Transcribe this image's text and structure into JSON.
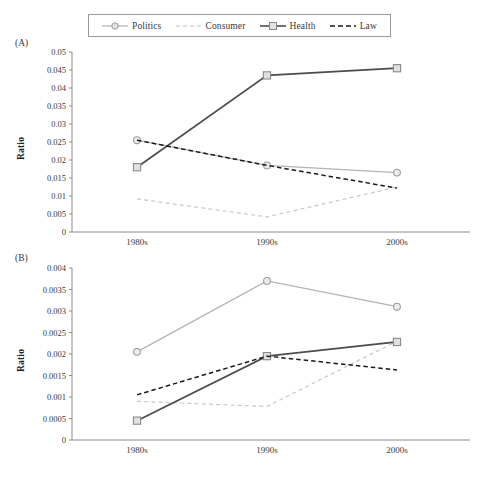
{
  "figure": {
    "panel_a_label": "(A)",
    "panel_b_label": "(B)",
    "y_axis_title": "Ratio"
  },
  "legend": {
    "items": [
      {
        "label": "Politics",
        "style": "solid-circle",
        "color": "#b3b3b3",
        "marker": "circle"
      },
      {
        "label": "Consumer",
        "style": "dashed",
        "color": "#c8c8c8",
        "marker": "none"
      },
      {
        "label": "Health",
        "style": "solid-square",
        "color": "#4d4d4d",
        "marker": "square"
      },
      {
        "label": "Law",
        "style": "dashed",
        "color": "#1a1a1a",
        "marker": "none"
      }
    ]
  },
  "chart_data": [
    {
      "type": "line",
      "panel": "(A)",
      "title": "",
      "xlabel": "",
      "ylabel": "Ratio",
      "categories": [
        "1980s",
        "1990s",
        "2000s"
      ],
      "ylim": [
        0,
        0.05
      ],
      "yticks": [
        "0",
        "0.005",
        "0.01",
        "0.015",
        "0.02",
        "0.025",
        "0.03",
        "0.035",
        "0.04",
        "0.045",
        "0.05"
      ],
      "ytick_values": [
        0,
        0.005,
        0.01,
        0.015,
        0.02,
        0.025,
        0.03,
        0.035,
        0.04,
        0.045,
        0.05
      ],
      "grid": false,
      "legend_position": "top",
      "series": [
        {
          "name": "Politics",
          "values": [
            0.0255,
            0.0185,
            0.0165
          ],
          "color": "#b3b3b3",
          "dash": "none",
          "marker": "circle"
        },
        {
          "name": "Consumer",
          "values": [
            0.0092,
            0.0042,
            0.0125
          ],
          "color": "#c8c8c8",
          "dash": "dashed",
          "marker": "none"
        },
        {
          "name": "Health",
          "values": [
            0.018,
            0.0435,
            0.0455
          ],
          "color": "#4d4d4d",
          "dash": "none",
          "marker": "square"
        },
        {
          "name": "Law",
          "values": [
            0.0255,
            0.0185,
            0.0122
          ],
          "color": "#1a1a1a",
          "dash": "dashed",
          "marker": "none"
        }
      ]
    },
    {
      "type": "line",
      "panel": "(B)",
      "title": "",
      "xlabel": "",
      "ylabel": "Ratio",
      "categories": [
        "1980s",
        "1990s",
        "2000s"
      ],
      "ylim": [
        0,
        0.004
      ],
      "yticks": [
        "0",
        "0.0005",
        "0.001",
        "0.0015",
        "0.002",
        "0.0025",
        "0.003",
        "0.0035",
        "0.004"
      ],
      "ytick_values": [
        0,
        0.0005,
        0.001,
        0.0015,
        0.002,
        0.0025,
        0.003,
        0.0035,
        0.004
      ],
      "grid": false,
      "legend_position": "top",
      "series": [
        {
          "name": "Politics",
          "values": [
            0.00205,
            0.0037,
            0.0031
          ],
          "color": "#b3b3b3",
          "dash": "none",
          "marker": "circle"
        },
        {
          "name": "Consumer",
          "values": [
            0.0009,
            0.00078,
            0.0023
          ],
          "color": "#c8c8c8",
          "dash": "dashed",
          "marker": "none"
        },
        {
          "name": "Health",
          "values": [
            0.00045,
            0.00195,
            0.00228
          ],
          "color": "#4d4d4d",
          "dash": "none",
          "marker": "square"
        },
        {
          "name": "Law",
          "values": [
            0.00105,
            0.00195,
            0.00163
          ],
          "color": "#1a1a1a",
          "dash": "dashed",
          "marker": "none"
        }
      ]
    }
  ]
}
